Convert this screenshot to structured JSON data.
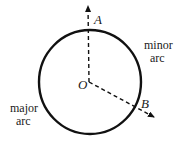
{
  "diagram": {
    "type": "circle-arcs",
    "center": {
      "label": "O",
      "x": 89,
      "y": 82
    },
    "radius": 52,
    "points": [
      {
        "label": "A",
        "description": "point on circle, top"
      },
      {
        "label": "B",
        "description": "point on circle, lower right"
      }
    ],
    "arcs": [
      {
        "label_line1": "minor",
        "label_line2": "arc"
      },
      {
        "label_line1": "major",
        "label_line2": "arc"
      }
    ],
    "colors": {
      "stroke": "#111111",
      "text": "#1a1a1a"
    }
  }
}
